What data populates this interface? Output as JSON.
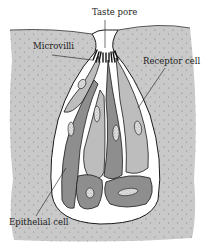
{
  "diagram": {
    "labels": {
      "taste_pore": "Taste pore",
      "microvilli": "Microvilli",
      "receptor_cell": "Receptor cell",
      "epithelial_cell": "Epithelial cell"
    },
    "colors": {
      "tissue": "#c8c8c8",
      "tissue_dots": "#7a7a7a",
      "bud_background": "#ffffff",
      "receptor_cell_fill": "#bdbdbd",
      "dark_cell_fill": "#8e8e8e",
      "nucleus_fill": "#e2e2e2",
      "outline": "#1a1a1a"
    }
  }
}
